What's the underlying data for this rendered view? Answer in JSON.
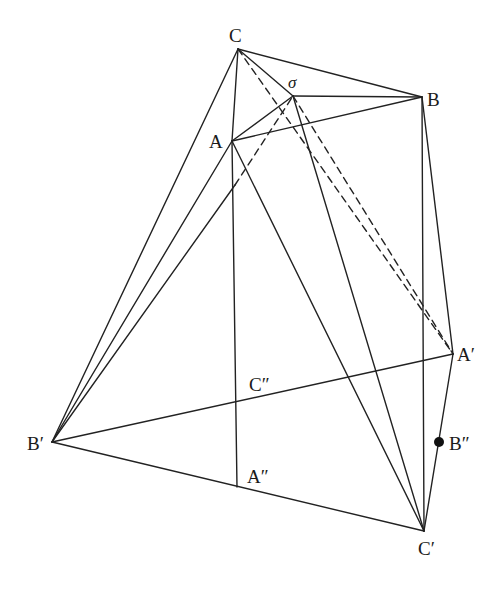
{
  "diagram": {
    "points": {
      "C": {
        "label": "C",
        "x": 238,
        "y": 49,
        "lx": 229,
        "ly": 42
      },
      "sigma": {
        "label": "σ",
        "x": 293,
        "y": 96,
        "lx": 288,
        "ly": 88
      },
      "B": {
        "label": "B",
        "x": 422,
        "y": 97,
        "lx": 427,
        "ly": 106
      },
      "A": {
        "label": "A",
        "x": 232,
        "y": 141,
        "lx": 209,
        "ly": 148
      },
      "Ap": {
        "label": "A′",
        "x": 453,
        "y": 354,
        "lx": 457,
        "ly": 361
      },
      "Cpp": {
        "label": "C″",
        "x": 237,
        "y": 398,
        "lx": 249,
        "ly": 391
      },
      "Bp": {
        "label": "B′",
        "x": 52,
        "y": 442,
        "lx": 27,
        "ly": 450
      },
      "Bpp": {
        "label": "B″",
        "x": 439,
        "y": 442,
        "lx": 449,
        "ly": 450
      },
      "App": {
        "label": "A″",
        "x": 237,
        "y": 487,
        "lx": 247,
        "ly": 483
      },
      "Cp": {
        "label": "C′",
        "x": 424,
        "y": 531,
        "lx": 418,
        "ly": 555
      }
    },
    "solid_lines": [
      [
        "C",
        "B"
      ],
      [
        "C",
        "A"
      ],
      [
        "C",
        "sigma"
      ],
      [
        "sigma",
        "B"
      ],
      [
        "A",
        "B"
      ],
      [
        "A",
        "sigma"
      ],
      [
        "C",
        "Bp"
      ],
      [
        "A",
        "Bp"
      ],
      [
        "Bp",
        "Ap"
      ],
      [
        "Bp",
        "Cp"
      ],
      [
        "A",
        "App"
      ],
      [
        "A",
        "Cp"
      ],
      [
        "sigma",
        "Cp"
      ],
      [
        "B",
        "Ap"
      ],
      [
        "B",
        "Cp"
      ],
      [
        "Ap",
        "Cp"
      ]
    ],
    "dashed_lines": [
      [
        "C",
        "Ap"
      ],
      [
        "sigma",
        "Ap"
      ]
    ],
    "partial_line": {
      "from": "Bp",
      "to": "sigma",
      "solid_until": [
        235,
        185
      ]
    },
    "marked_point": "Bpp"
  }
}
